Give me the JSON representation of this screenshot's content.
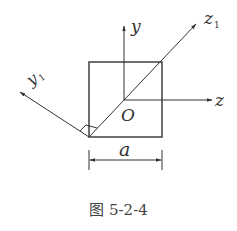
{
  "figure": {
    "caption": "图 5-2-4",
    "labels": {
      "y": "y",
      "z": "z",
      "z1_main": "z",
      "z1_sub": "1",
      "y1_main": "y",
      "y1_sub": "1",
      "origin": "O",
      "dimension": "a"
    }
  },
  "colors": {
    "stroke": "#333333",
    "text": "#333333"
  }
}
